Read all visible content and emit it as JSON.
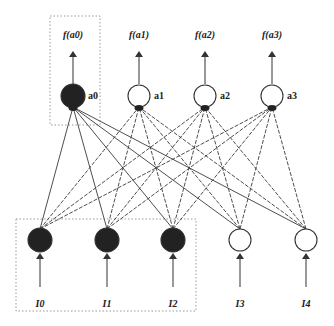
{
  "diagram": {
    "type": "neural-network",
    "output_labels": [
      "f(a0)",
      "f(a1)",
      "f(a2)",
      "f(a3)"
    ],
    "output_nodes": [
      {
        "id": "a0",
        "label": "a0",
        "filled": true,
        "x": 73,
        "y": 96
      },
      {
        "id": "a1",
        "label": "a1",
        "filled": false,
        "x": 139,
        "y": 96
      },
      {
        "id": "a2",
        "label": "a2",
        "filled": false,
        "x": 205,
        "y": 96
      },
      {
        "id": "a3",
        "label": "a3",
        "filled": false,
        "x": 272,
        "y": 96
      }
    ],
    "input_nodes": [
      {
        "id": "I0",
        "label": "I0",
        "filled": true,
        "x": 40,
        "y": 240
      },
      {
        "id": "I1",
        "label": "I1",
        "filled": true,
        "x": 107,
        "y": 240
      },
      {
        "id": "I2",
        "label": "I2",
        "filled": true,
        "x": 173,
        "y": 240
      },
      {
        "id": "I3",
        "label": "I3",
        "filled": false,
        "x": 240,
        "y": 240
      },
      {
        "id": "I4",
        "label": "I4",
        "filled": false,
        "x": 306,
        "y": 240
      }
    ],
    "highlight_boxes": [
      {
        "name": "output-a0-box",
        "x": 50,
        "y": 16,
        "w": 50,
        "h": 109
      },
      {
        "name": "input-active-box",
        "x": 16,
        "y": 219,
        "w": 180,
        "h": 92
      }
    ],
    "connections": "fully-connected: every input node to every output node"
  }
}
